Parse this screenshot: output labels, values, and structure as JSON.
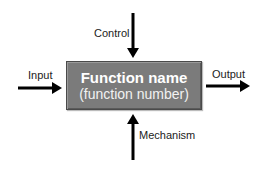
{
  "diagram": {
    "type": "IDEF0 function block",
    "box": {
      "title": "Function name",
      "subtitle": "(function number)",
      "fill_color": "#7b7b7b",
      "text_color": "#ffffff"
    },
    "arrows": {
      "input": {
        "label": "Input",
        "direction": "right"
      },
      "control": {
        "label": "Control",
        "direction": "down"
      },
      "output": {
        "label": "Output",
        "direction": "right"
      },
      "mechanism": {
        "label": "Mechanism",
        "direction": "up"
      }
    },
    "arrow_color": "#000000"
  }
}
